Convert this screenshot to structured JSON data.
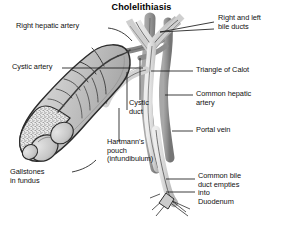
{
  "figure": {
    "title": "Cholelithiasis",
    "background_color": "#ffffff",
    "text_color": "#111111",
    "palette": {
      "duct_fill": "#d9d9d9",
      "duct_mid": "#bdbdbd",
      "vessel_fill": "#9a9a9a",
      "vessel_dark": "#7d7d7d",
      "gallbladder_fill": "#c9c9c9",
      "gallbladder_shadow": "#a8a8a8",
      "stone_fill": "#cfcfcf",
      "outline": "#2b2b2b",
      "leader_line": "#1a1a1a"
    },
    "labels": [
      {
        "id": "right-hepatic-artery",
        "text": "Right hepatic artery",
        "side": "left",
        "lines": 1,
        "x": 16,
        "y": 26
      },
      {
        "id": "right-and-left-bile-ducts",
        "text": "Right and left\nbile ducts",
        "side": "right",
        "lines": 2,
        "x": 218,
        "y": 14
      },
      {
        "id": "cystic-artery",
        "text": "Cystic artery",
        "side": "left",
        "lines": 1,
        "x": 12,
        "y": 66
      },
      {
        "id": "triangle-of-calot",
        "text": "Triangle of Calot",
        "side": "right",
        "lines": 1,
        "x": 196,
        "y": 69
      },
      {
        "id": "common-hepatic-artery",
        "text": "Common hepatic\nartery",
        "side": "right",
        "lines": 2,
        "x": 196,
        "y": 91
      },
      {
        "id": "cystic-duct",
        "text": "Cystic\nduct",
        "side": "center",
        "lines": 2,
        "x": 129,
        "y": 100
      },
      {
        "id": "portal-vein",
        "text": "Portal vein",
        "side": "right",
        "lines": 1,
        "x": 196,
        "y": 128
      },
      {
        "id": "hartmanns-pouch",
        "text": "Hartmann's\npouch\n(infundibulum)",
        "side": "center",
        "lines": 3,
        "x": 109,
        "y": 140
      },
      {
        "id": "gallstones-in-fundus",
        "text": "Gallstones\nin fundus",
        "side": "left",
        "lines": 2,
        "x": 10,
        "y": 170
      },
      {
        "id": "common-bile-duct-duodenum",
        "text": "Common bile\nduct empties\ninto\nDuodenum",
        "side": "right",
        "lines": 4,
        "x": 198,
        "y": 174
      }
    ],
    "structures": [
      {
        "id": "right-hepatic-duct",
        "name": "right hepatic duct"
      },
      {
        "id": "left-hepatic-duct",
        "name": "left hepatic duct"
      },
      {
        "id": "common-hepatic-duct",
        "name": "common hepatic duct"
      },
      {
        "id": "common-bile-duct",
        "name": "common bile duct"
      },
      {
        "id": "cystic-duct",
        "name": "cystic duct"
      },
      {
        "id": "gallbladder",
        "name": "gallbladder"
      },
      {
        "id": "cystic-artery",
        "name": "cystic artery"
      },
      {
        "id": "right-hepatic-artery",
        "name": "right hepatic artery"
      },
      {
        "id": "common-hepatic-artery",
        "name": "common hepatic artery"
      },
      {
        "id": "portal-vein",
        "name": "portal vein"
      },
      {
        "id": "gallstones",
        "name": "gallstones"
      },
      {
        "id": "biliary-sludge",
        "name": "biliary sludge"
      },
      {
        "id": "duodenal-papilla",
        "name": "duodenal papilla"
      }
    ]
  }
}
